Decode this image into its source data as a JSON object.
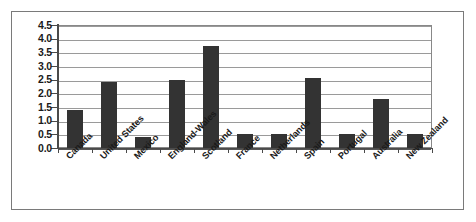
{
  "chart_data": {
    "type": "bar",
    "title": "",
    "subtitle": "",
    "xlabel": "",
    "ylabel": "",
    "ylim": [
      0.0,
      4.5
    ],
    "ytick_step": 0.5,
    "grid": true,
    "legend": false,
    "legend_position": "none",
    "orientation": "vertical",
    "bar_color": "#333333",
    "plot_background": "#ffffff",
    "gridline_color": "#9a9a9a",
    "axis_color": "#4a4a4a",
    "frame_color": "#7a7a7a",
    "xtick_label_rotation": -45,
    "categories": [
      "Canada",
      "United States",
      "Mexico",
      "England-Wales",
      "Scotland",
      "France",
      "Netherlands",
      "Spain",
      "Portugal",
      "Australia",
      "New Zealand"
    ],
    "values": [
      1.4,
      2.4,
      0.4,
      2.5,
      3.75,
      0.5,
      0.5,
      2.55,
      0.5,
      1.8,
      0.5
    ],
    "ytick_labels": [
      "0.0",
      "0.5",
      "1.0",
      "1.5",
      "2.0",
      "2.5",
      "3.0",
      "3.5",
      "4.0",
      "4.5"
    ],
    "ytick_values": [
      0.0,
      0.5,
      1.0,
      1.5,
      2.0,
      2.5,
      3.0,
      3.5,
      4.0,
      4.5
    ]
  }
}
